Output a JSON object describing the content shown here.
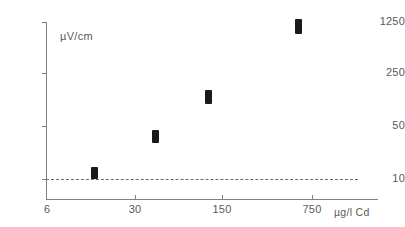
{
  "chart_data": {
    "type": "scatter",
    "title": "",
    "subtitle": "",
    "xlabel": "µg/l  Cd",
    "ylabel": "µV/cm",
    "x_tick_labels": [
      "6",
      "30",
      "150",
      "750"
    ],
    "y_tick_labels": [
      "1250",
      "250",
      "50",
      "10"
    ],
    "x_scale": "log",
    "y_scale": "log",
    "grid": false,
    "legend": null,
    "annotations": [
      {
        "name": "detection-threshold",
        "type": "dashed-horizontal-line",
        "y_value": 10
      }
    ],
    "points": [
      {
        "x": 6,
        "y": 13,
        "y_low": 11,
        "y_high": 16
      },
      {
        "x": 30,
        "y": 40,
        "y_low": 33,
        "y_high": 48
      },
      {
        "x": 150,
        "y": 130,
        "y_low": 105,
        "y_high": 165
      },
      {
        "x": 750,
        "y": 1050,
        "y_low": 880,
        "y_high": 1220
      }
    ]
  },
  "axes": {
    "y_ticks": [
      {
        "label": "1250",
        "top": 22
      },
      {
        "label": "250",
        "top": 73
      },
      {
        "label": "50",
        "top": 126
      },
      {
        "label": "10",
        "top": 179
      }
    ],
    "x_ticks": [
      {
        "label": "6",
        "left": 46
      },
      {
        "label": "30",
        "left": 135
      },
      {
        "label": "150",
        "left": 222
      },
      {
        "label": "750",
        "left": 312
      }
    ],
    "y_title": "µV/cm",
    "x_title": "µg/l  Cd"
  },
  "markers": [
    {
      "name": "data-marker-6",
      "left": 91,
      "top": 167,
      "width": 7,
      "height": 12
    },
    {
      "name": "data-marker-30",
      "left": 152,
      "top": 130,
      "width": 7,
      "height": 13
    },
    {
      "name": "data-marker-150",
      "left": 205,
      "top": 90,
      "width": 7,
      "height": 14
    },
    {
      "name": "data-marker-750",
      "left": 295,
      "top": 19,
      "width": 7,
      "height": 15
    }
  ],
  "colors": {
    "marker": "#1a1a1a",
    "axis": "#808080",
    "text": "#5a5a5a",
    "background": "#ffffff",
    "threshold": "#6b6b6b"
  }
}
